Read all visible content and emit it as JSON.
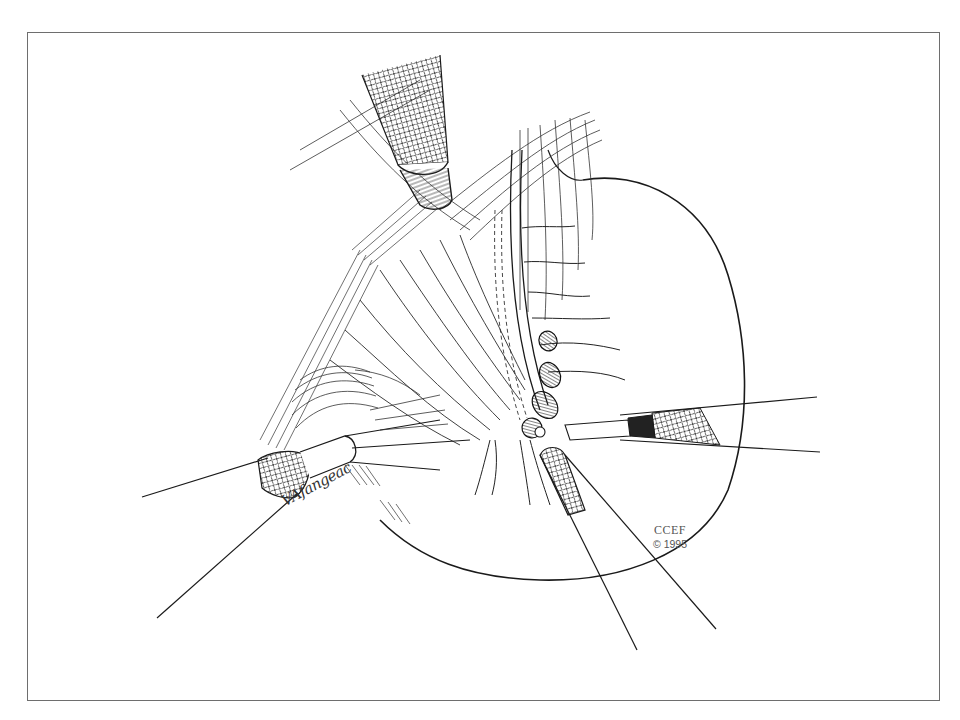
{
  "figure": {
    "border_color": "#6e6e6e",
    "line_color": "#1a1a1a",
    "background": "#ffffff"
  },
  "credit": {
    "organization": "CCEF",
    "copyright": "© 1995"
  },
  "signature": {
    "text": "VAfangeac"
  },
  "instruments": [
    {
      "name": "upper-trocar",
      "position": "top-center"
    },
    {
      "name": "left-grasper",
      "position": "lower-left"
    },
    {
      "name": "center-grasper",
      "position": "bottom-center"
    },
    {
      "name": "right-grasper",
      "position": "right"
    }
  ]
}
